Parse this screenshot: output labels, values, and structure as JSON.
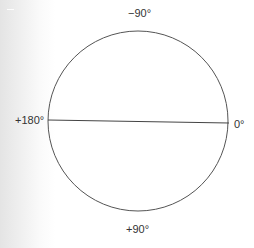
{
  "diagram": {
    "title": "",
    "type": "circle-angle-diagram",
    "circle": {
      "cx": 138,
      "cy": 121,
      "r": 90,
      "stroke": "#555555"
    },
    "diameter_line": {
      "x1": 48,
      "y1": 120,
      "x2": 229,
      "y2": 123,
      "stroke": "#444444"
    },
    "labels": {
      "top": "−90°",
      "left": "+180°",
      "right": "0°",
      "bottom": "+90°"
    },
    "colors": {
      "background": "#ffffff",
      "edge_gradient": "#e4e4e4",
      "text": "#333333"
    }
  }
}
